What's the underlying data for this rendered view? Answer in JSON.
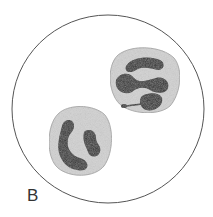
{
  "figure": {
    "panel_label": "B",
    "cells": [
      {
        "name": "upper-right cell",
        "nucleus": "multi-lobed, segments linked by thin chromatin strand"
      },
      {
        "name": "lower-left cell",
        "nucleus": "band/lobed nucleus, C-shaped"
      }
    ],
    "colors": {
      "background": "#ffffff",
      "field_outline": "#555555",
      "cytoplasm": "#d4d4d4",
      "nucleus": "#2a2a2a"
    }
  }
}
